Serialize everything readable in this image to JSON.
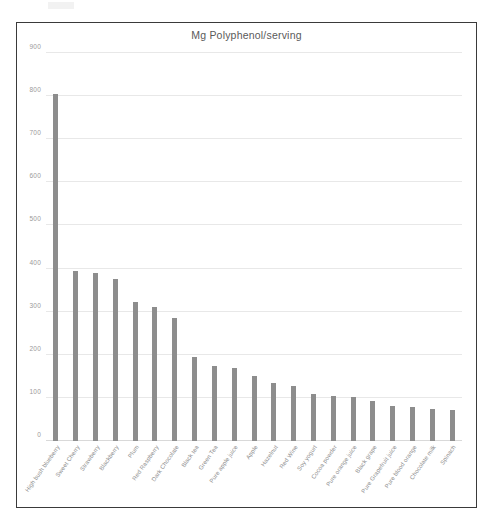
{
  "chart_data": {
    "type": "bar",
    "title": "Mg Polyphenol/serving",
    "xlabel": "",
    "ylabel": "",
    "ylim": [
      0,
      900
    ],
    "ytick_step": 100,
    "yticks": [
      0,
      100,
      200,
      300,
      400,
      500,
      600,
      700,
      800,
      900
    ],
    "ytick_labels": [
      "0",
      "100",
      "200",
      "300",
      "400",
      "500",
      "600",
      "700",
      "800",
      "900"
    ],
    "grid": true,
    "legend": false,
    "bar_color": "#8d8d8d",
    "categories": [
      "High bush blueberry",
      "Sweet Cherry",
      "Strawberry",
      "Blackberry",
      "Plum",
      "Red Raspberry",
      "Dark Chocolate",
      "Black tea",
      "Green Tea",
      "Pure apple juice",
      "Apple",
      "Hazelnut",
      "Red Wine",
      "Soy yogurt",
      "Cocoa powder",
      "Pure orange juice",
      "Black grape",
      "Pure Grapefruit juice",
      "Pure blood orange",
      "Chocolate milk",
      "Spinach"
    ],
    "values": [
      805,
      395,
      390,
      375,
      322,
      312,
      285,
      196,
      175,
      170,
      150,
      135,
      128,
      108,
      105,
      103,
      93,
      82,
      80,
      75,
      72
    ]
  },
  "artifact": {
    "top_mark": ""
  }
}
